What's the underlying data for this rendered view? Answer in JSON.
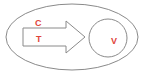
{
  "diagram": {
    "outer_ellipse": {
      "cx": 72,
      "cy": 37,
      "rx": 66,
      "ry": 33,
      "stroke": "#8a8a8a"
    },
    "arrow": {
      "stroke": "#8a8a8a",
      "points": "23,28 66,28 66,21 85,37 66,53 66,46 23,46"
    },
    "circle": {
      "cx": 108,
      "cy": 38,
      "r": 19,
      "stroke": "#8a8a8a"
    },
    "labels": {
      "top": "C",
      "bottom": "T",
      "circle": "V"
    },
    "label_color": "#e0443a"
  }
}
